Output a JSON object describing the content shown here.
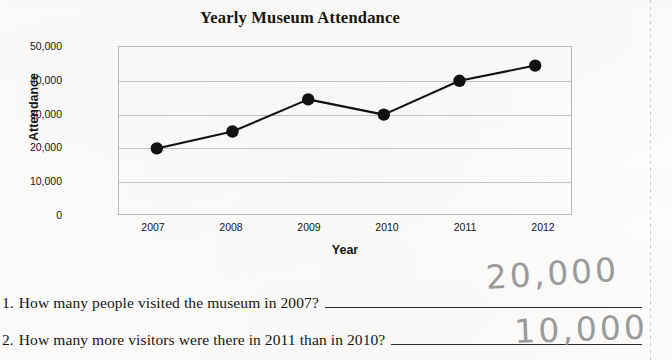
{
  "worksheet": {
    "chart_title": "Yearly Museum Attendance",
    "x_axis_title": "Year",
    "y_axis_title": "Attendance",
    "questions": [
      {
        "number": "1.",
        "text": "How many people visited the museum in 2007?",
        "handwritten_answer": "20,000"
      },
      {
        "number": "2.",
        "text": "How many more visitors were there in 2011 than in 2010?",
        "handwritten_answer": "10,000"
      }
    ]
  },
  "chart_data": {
    "type": "line",
    "title": "Yearly Museum Attendance",
    "xlabel": "Year",
    "ylabel": "Attendance",
    "categories": [
      "2007",
      "2008",
      "2009",
      "2010",
      "2011",
      "2012"
    ],
    "values": [
      20000,
      25000,
      34500,
      30000,
      40000,
      44500
    ],
    "ylim": [
      0,
      50000
    ],
    "ytick_labels": [
      "0",
      "10,000",
      "20,000",
      "30,000",
      "40,000",
      "50,000"
    ],
    "ytick_values": [
      0,
      10000,
      20000,
      30000,
      40000,
      50000
    ],
    "grid": true,
    "legend": "none",
    "marker": "filled-circle",
    "line_color": "#111111",
    "marker_color": "#111111"
  },
  "colors": {
    "paper": "#fdfdfc",
    "ink": "#151515",
    "gridline": "#c2c2c0",
    "pencil": "#8d8d8f"
  }
}
